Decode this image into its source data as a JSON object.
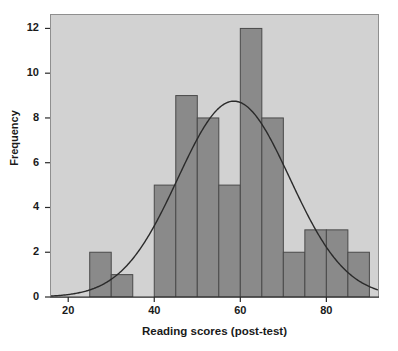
{
  "chart_data": {
    "type": "bar",
    "title": "",
    "subtitle": "",
    "xlabel": "Reading scores (post-test)",
    "ylabel": "Frequency",
    "xlim": [
      16,
      92
    ],
    "ylim": [
      0,
      12.6
    ],
    "bin_width": 5,
    "grid": false,
    "legend": null,
    "categories": [
      "25-30",
      "30-35",
      "35-40",
      "40-45",
      "45-50",
      "50-55",
      "55-60",
      "60-65",
      "65-70",
      "70-75",
      "75-80",
      "80-85",
      "85-90"
    ],
    "bin_starts": [
      25,
      30,
      35,
      40,
      45,
      50,
      55,
      60,
      65,
      70,
      75,
      80,
      85
    ],
    "values": [
      2,
      1,
      0,
      5,
      9,
      8,
      5,
      12,
      8,
      2,
      3,
      3,
      2
    ],
    "xticks": [
      20,
      40,
      60,
      80
    ],
    "xtick_labels": [
      "20",
      "40",
      "60",
      "80"
    ],
    "yticks": [
      0,
      2,
      4,
      6,
      8,
      10,
      12
    ],
    "ytick_labels": [
      "0",
      "2",
      "4",
      "6",
      "8",
      "10",
      "12"
    ],
    "overlay": {
      "type": "normal-curve",
      "mean": 58.5,
      "std": 13.0,
      "peak_value": 8.75,
      "description": "normal distribution curve"
    },
    "colors": {
      "bar_fill": "#8a8a8a",
      "bar_stroke": "#4a4a4a",
      "plot_background": "#d2d2d2",
      "curve": "#2a2a2a",
      "axis": "#2a2a2a",
      "text": "#1a1a1a",
      "page_background": "#ffffff"
    }
  }
}
